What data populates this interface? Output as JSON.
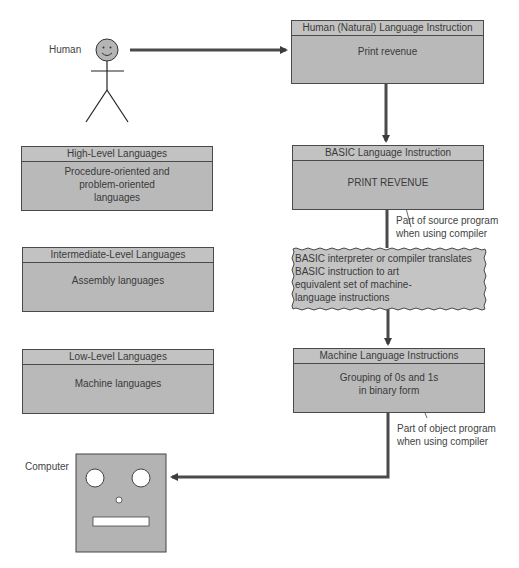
{
  "human": {
    "label": "Human"
  },
  "computer": {
    "label": "Computer"
  },
  "flow": {
    "natural": {
      "title": "Human (Natural) Language Instruction",
      "body": "Print revenue"
    },
    "basic": {
      "title": "BASIC Language Instruction",
      "body": "PRINT REVENUE",
      "note": [
        "Part of source program",
        "when using compiler"
      ]
    },
    "translate": {
      "lines": [
        "BASIC interpreter or compiler translates",
        "BASIC instruction to art",
        "equivalent set of machine-",
        "language instructions"
      ]
    },
    "machine": {
      "title": "Machine Language Instructions",
      "body": [
        "Grouping of 0s and 1s",
        "in binary form"
      ],
      "note": [
        "Part of object program",
        "when using compiler"
      ]
    }
  },
  "levels": [
    {
      "title": "High-Level Languages",
      "body": [
        "Procedure-oriented and",
        "problem-oriented",
        "languages"
      ]
    },
    {
      "title": "Intermediate-Level Languages",
      "body": [
        "Assembly languages"
      ]
    },
    {
      "title": "Low-Level Languages",
      "body": [
        "Machine languages"
      ]
    }
  ],
  "colors": {
    "box_fill": "#b9b9b9",
    "line": "#4a4a4a",
    "arrow": "#3c3c3c"
  }
}
